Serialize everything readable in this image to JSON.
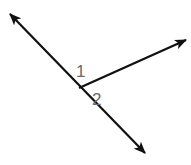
{
  "diagram": {
    "type": "angle-diagram",
    "colors": {
      "line": "#111111",
      "label": "#6b6b6b",
      "background": "#ffffff"
    },
    "vertex": {
      "x": 79,
      "y": 88
    },
    "line": {
      "start": {
        "x": 10,
        "y": 14
      },
      "end": {
        "x": 145,
        "y": 153
      }
    },
    "ray": {
      "start": {
        "x": 79,
        "y": 88
      },
      "end": {
        "x": 186,
        "y": 40
      }
    },
    "labels": [
      {
        "id": "angle-1",
        "text": "1",
        "x": 76,
        "y": 77
      },
      {
        "id": "angle-2",
        "text": "2",
        "x": 92,
        "y": 105
      }
    ]
  }
}
